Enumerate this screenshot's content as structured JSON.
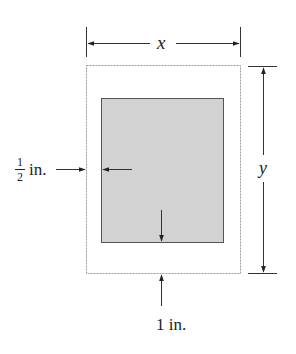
{
  "figure": {
    "type": "poster-margin-diagram",
    "colors": {
      "line": "#333333",
      "outer_border": "#9a9a9a",
      "printed_area_fill": "#d2d2d2",
      "printed_area_border": "#555555",
      "background": "#ffffff"
    },
    "labels": {
      "width_dimension": "x",
      "height_dimension": "y",
      "side_margin_numerator": "1",
      "side_margin_denominator": "2",
      "side_margin_unit": "in.",
      "bottom_margin": "1 in."
    }
  }
}
